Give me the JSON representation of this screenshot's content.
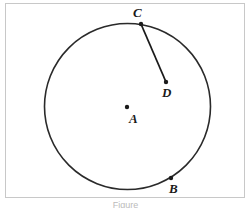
{
  "figure": {
    "circle": {
      "cx": 127.5,
      "cy": 106.5,
      "r": 83,
      "stroke": "#2a2a2a"
    },
    "segment": {
      "from": "C",
      "to": "D",
      "stroke": "#1a1a1a"
    },
    "points": [
      {
        "id": "A",
        "label": "A",
        "x": 127,
        "y": 107,
        "label_x": 129,
        "label_y": 123
      },
      {
        "id": "B",
        "label": "B",
        "x": 171,
        "y": 178,
        "label_x": 169,
        "label_y": 193
      },
      {
        "id": "C",
        "label": "C",
        "x": 141,
        "y": 24,
        "label_x": 133,
        "label_y": 17
      },
      {
        "id": "D",
        "label": "D",
        "x": 166,
        "y": 82,
        "label_x": 162,
        "label_y": 97
      }
    ],
    "frame_color": "#c8c8c8"
  },
  "caption": "Figure"
}
